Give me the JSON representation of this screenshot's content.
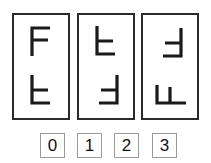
{
  "puzzle": {
    "type": "letter-rotation-matching",
    "letter": "F",
    "stroke_color": "#1a1a1a",
    "border_color": "#2a2a2a",
    "cards": [
      {
        "index": 0,
        "top": {
          "letter": "F",
          "transform": "none"
        },
        "bottom": {
          "letter": "F",
          "transform": "flip-vertical"
        }
      },
      {
        "index": 1,
        "top": {
          "letter": "F",
          "transform": "flip-vertical"
        },
        "bottom": {
          "letter": "F",
          "transform": "rotate-180"
        }
      },
      {
        "index": 2,
        "top": {
          "letter": "F",
          "transform": "rotate-180"
        },
        "bottom": {
          "letter": "F",
          "transform": "rotate-90"
        }
      }
    ],
    "answers": [
      {
        "label": "0"
      },
      {
        "label": "1"
      },
      {
        "label": "2"
      },
      {
        "label": "3"
      }
    ]
  }
}
